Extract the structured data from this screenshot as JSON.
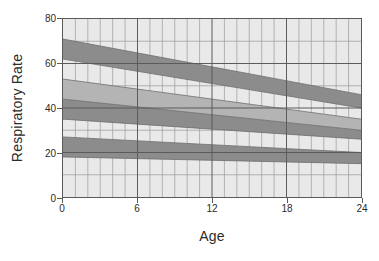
{
  "chart_data": {
    "type": "area",
    "title": "",
    "xlabel": "Age",
    "ylabel": "Respiratory Rate",
    "xlim": [
      0,
      24
    ],
    "ylim": [
      0,
      80
    ],
    "xticks": [
      0,
      6,
      12,
      18,
      24
    ],
    "yticks": [
      0,
      20,
      40,
      60,
      80
    ],
    "x_minor_step": 1,
    "y_minor_step": 10,
    "grid": true,
    "legend": "none",
    "x": [
      0,
      24
    ],
    "colors": {
      "plot_background": "#e9e9e9",
      "band_dark": "#8c8c8c",
      "band_light": "#b4b4b4",
      "gridline_major": "#5a5a5a",
      "gridline_minor": "#9a9a9a",
      "axis": "#5a5a5a",
      "text": "#2b2b2b"
    },
    "bands": [
      {
        "name": "upper-dark-band",
        "shade": "dark",
        "upper": [
          71,
          46
        ],
        "lower": [
          62,
          40
        ]
      },
      {
        "name": "middle-light-band",
        "shade": "light",
        "upper": [
          53,
          35
        ],
        "lower": [
          44,
          30
        ]
      },
      {
        "name": "middle-dark-band",
        "shade": "dark",
        "upper": [
          44,
          30
        ],
        "lower": [
          35,
          26
        ]
      },
      {
        "name": "lower-dark-band",
        "shade": "dark",
        "upper": [
          27,
          20
        ],
        "lower": [
          18,
          15
        ]
      }
    ],
    "band_lines": [
      {
        "name": "upper-band-top-line",
        "values": [
          71,
          46
        ]
      },
      {
        "name": "upper-band-bottom-line",
        "values": [
          62,
          40
        ]
      },
      {
        "name": "middle-light-top-line",
        "values": [
          53,
          35
        ]
      },
      {
        "name": "middle-mid-line",
        "values": [
          44,
          30
        ]
      },
      {
        "name": "middle-dark-bottom-line",
        "values": [
          35,
          26
        ]
      },
      {
        "name": "lower-band-top-line",
        "values": [
          27,
          20
        ]
      },
      {
        "name": "lower-band-bottom-line",
        "values": [
          18,
          15
        ]
      }
    ]
  },
  "axes": {
    "y_title": "Respiratory Rate",
    "x_title": "Age",
    "y_tick_labels": [
      "0",
      "20",
      "40",
      "60",
      "80"
    ],
    "x_tick_labels": [
      "0",
      "6",
      "12",
      "18",
      "24"
    ]
  }
}
